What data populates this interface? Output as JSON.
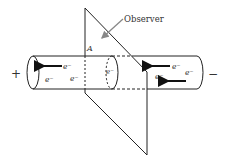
{
  "diagram": {
    "labels": {
      "observer": "Observer",
      "point_a": "A",
      "positive_terminal": "+",
      "negative_terminal": "−",
      "electron": "e⁻"
    },
    "electrons_left": [
      "e⁻",
      "e⁻",
      "e⁻"
    ],
    "electrons_center": [
      "e⁻"
    ],
    "electrons_right": [
      "e⁻",
      "e⁻",
      "e⁻"
    ],
    "arrows": {
      "direction": "left",
      "count": 3
    },
    "colors": {
      "line": "#222222",
      "observer_arrow": "#888888",
      "text": "#333333"
    }
  }
}
